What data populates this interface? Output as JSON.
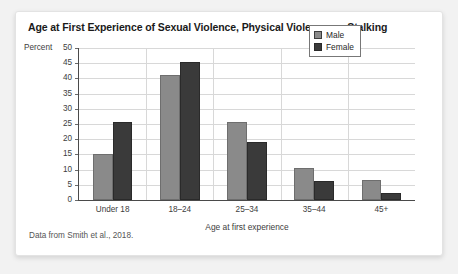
{
  "card": {
    "source_note": "Data from Smith et al., 2018."
  },
  "chart_data": {
    "type": "bar",
    "title": "Age at First Experience of Sexual Violence, Physical Violence, or Stalking",
    "xlabel": "Age at first experience",
    "ylabel": "Percent",
    "categories": [
      "Under 18",
      "18–24",
      "25–34",
      "35–44",
      "45+"
    ],
    "series": [
      {
        "name": "Male",
        "color": "#8a8a8a",
        "values": [
          15,
          41,
          25.8,
          10.4,
          6.7
        ]
      },
      {
        "name": "Female",
        "color": "#3a3a3a",
        "values": [
          25.5,
          45.3,
          19,
          6.3,
          2.4
        ]
      }
    ],
    "ylim": [
      0,
      50
    ],
    "yticks": [
      0,
      5,
      10,
      15,
      20,
      25,
      30,
      35,
      40,
      45,
      50
    ],
    "ytick_labels": [
      "0",
      "5",
      "10",
      "15",
      "20",
      "25",
      "30",
      "35",
      "40",
      "45",
      "50"
    ],
    "grid": true,
    "legend_position": "top-right"
  }
}
